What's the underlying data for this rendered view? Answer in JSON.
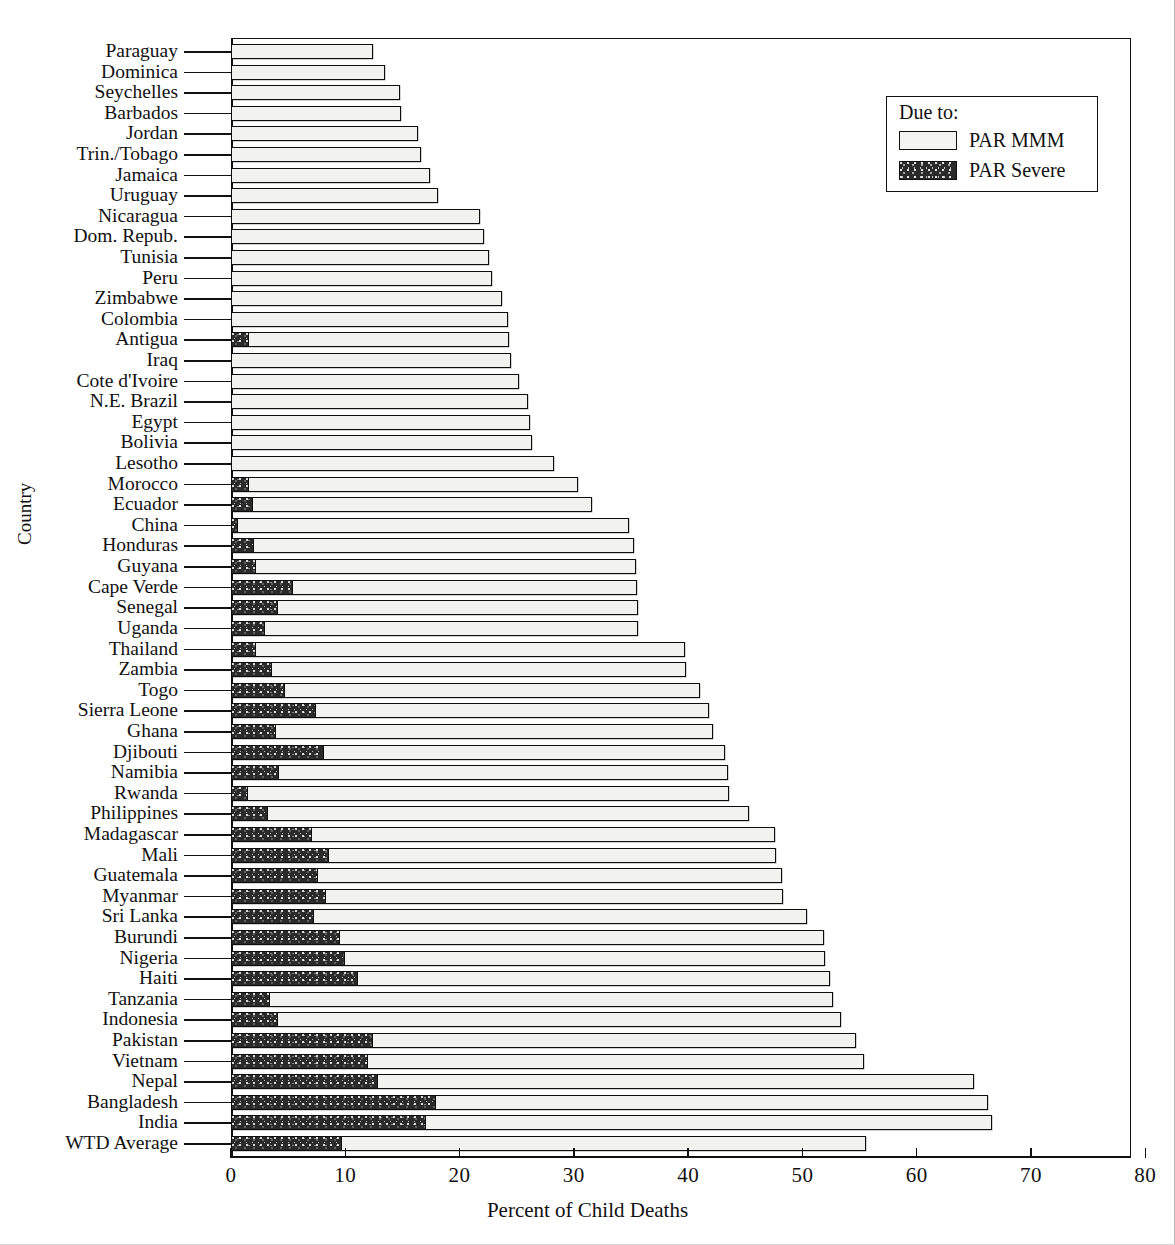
{
  "chart_data": {
    "type": "bar",
    "orientation": "horizontal",
    "stacked": true,
    "title": "",
    "xlabel": "Percent of Child Deaths",
    "ylabel": "Country",
    "xlim": [
      0,
      80
    ],
    "xticks": [
      0,
      10,
      20,
      30,
      40,
      50,
      60,
      70,
      80
    ],
    "grid": false,
    "legend": {
      "title": "Due to:",
      "position": "top-right",
      "entries": [
        {
          "label": "PAR MMM",
          "pattern": "light",
          "color": "#f2f2ef"
        },
        {
          "label": "PAR Severe",
          "pattern": "dark-stipple",
          "color": "#2a2a2a"
        }
      ]
    },
    "series": [
      {
        "name": "PAR Severe"
      },
      {
        "name": "PAR MMM"
      }
    ],
    "categories": [
      "Paraguay",
      "Dominica",
      "Seychelles",
      "Barbados",
      "Jordan",
      "Trin./Tobago",
      "Jamaica",
      "Uruguay",
      "Nicaragua",
      "Dom. Repub.",
      "Tunisia",
      "Peru",
      "Zimbabwe",
      "Colombia",
      "Antigua",
      "Iraq",
      "Cote d'Ivoire",
      "N.E. Brazil",
      "Egypt",
      "Bolivia",
      "Lesotho",
      "Morocco",
      "Ecuador",
      "China",
      "Honduras",
      "Guyana",
      "Cape Verde",
      "Senegal",
      "Uganda",
      "Thailand",
      "Zambia",
      "Togo",
      "Sierra Leone",
      "Ghana",
      "Djibouti",
      "Namibia",
      "Rwanda",
      "Philippines",
      "Madagascar",
      "Mali",
      "Guatemala",
      "Myanmar",
      "Sri Lanka",
      "Burundi",
      "Nigeria",
      "Haiti",
      "Tanzania",
      "Indonesia",
      "Pakistan",
      "Vietnam",
      "Nepal",
      "Bangladesh",
      "India",
      "WTD Average"
    ],
    "rows": [
      {
        "country": "Paraguay",
        "severe": 0.0,
        "total": 12.4
      },
      {
        "country": "Dominica",
        "severe": 0.0,
        "total": 13.5
      },
      {
        "country": "Seychelles",
        "severe": 0.0,
        "total": 14.8
      },
      {
        "country": "Barbados",
        "severe": 0.0,
        "total": 14.9
      },
      {
        "country": "Jordan",
        "severe": 0.0,
        "total": 16.4
      },
      {
        "country": "Trin./Tobago",
        "severe": 0.0,
        "total": 16.6
      },
      {
        "country": "Jamaica",
        "severe": 0.0,
        "total": 17.4
      },
      {
        "country": "Uruguay",
        "severe": 0.0,
        "total": 18.1
      },
      {
        "country": "Nicaragua",
        "severe": 0.0,
        "total": 21.8
      },
      {
        "country": "Dom. Repub.",
        "severe": 0.0,
        "total": 22.1
      },
      {
        "country": "Tunisia",
        "severe": 0.0,
        "total": 22.6
      },
      {
        "country": "Peru",
        "severe": 0.0,
        "total": 22.8
      },
      {
        "country": "Zimbabwe",
        "severe": 0.0,
        "total": 23.7
      },
      {
        "country": "Colombia",
        "severe": 0.0,
        "total": 24.2
      },
      {
        "country": "Antigua",
        "severe": 1.6,
        "total": 24.3
      },
      {
        "country": "Iraq",
        "severe": 0.0,
        "total": 24.5
      },
      {
        "country": "Cote d'Ivoire",
        "severe": 0.0,
        "total": 25.2
      },
      {
        "country": "N.E. Brazil",
        "severe": 0.0,
        "total": 26.0
      },
      {
        "country": "Egypt",
        "severe": 0.0,
        "total": 26.2
      },
      {
        "country": "Bolivia",
        "severe": 0.0,
        "total": 26.3
      },
      {
        "country": "Lesotho",
        "severe": 0.0,
        "total": 28.3
      },
      {
        "country": "Morocco",
        "severe": 1.6,
        "total": 30.4
      },
      {
        "country": "Ecuador",
        "severe": 1.9,
        "total": 31.6
      },
      {
        "country": "China",
        "severe": 0.6,
        "total": 34.8
      },
      {
        "country": "Honduras",
        "severe": 2.0,
        "total": 35.3
      },
      {
        "country": "Guyana",
        "severe": 2.2,
        "total": 35.4
      },
      {
        "country": "Cape Verde",
        "severe": 5.4,
        "total": 35.5
      },
      {
        "country": "Senegal",
        "severe": 4.1,
        "total": 35.6
      },
      {
        "country": "Uganda",
        "severe": 3.0,
        "total": 35.6
      },
      {
        "country": "Thailand",
        "severe": 2.2,
        "total": 39.7
      },
      {
        "country": "Zambia",
        "severe": 3.6,
        "total": 39.8
      },
      {
        "country": "Togo",
        "severe": 4.7,
        "total": 41.0
      },
      {
        "country": "Sierra Leone",
        "severe": 7.4,
        "total": 41.8
      },
      {
        "country": "Ghana",
        "severe": 3.9,
        "total": 42.2
      },
      {
        "country": "Djibouti",
        "severe": 8.1,
        "total": 43.2
      },
      {
        "country": "Namibia",
        "severe": 4.2,
        "total": 43.5
      },
      {
        "country": "Rwanda",
        "severe": 1.5,
        "total": 43.6
      },
      {
        "country": "Philippines",
        "severe": 3.2,
        "total": 45.3
      },
      {
        "country": "Madagascar",
        "severe": 7.1,
        "total": 47.6
      },
      {
        "country": "Mali",
        "severe": 8.6,
        "total": 47.7
      },
      {
        "country": "Guatemala",
        "severe": 7.6,
        "total": 48.2
      },
      {
        "country": "Myanmar",
        "severe": 8.3,
        "total": 48.3
      },
      {
        "country": "Sri Lanka",
        "severe": 7.3,
        "total": 50.4
      },
      {
        "country": "Burundi",
        "severe": 9.5,
        "total": 51.9
      },
      {
        "country": "Nigeria",
        "severe": 10.0,
        "total": 52.0
      },
      {
        "country": "Haiti",
        "severe": 11.1,
        "total": 52.4
      },
      {
        "country": "Tanzania",
        "severe": 3.4,
        "total": 52.7
      },
      {
        "country": "Indonesia",
        "severe": 4.1,
        "total": 53.4
      },
      {
        "country": "Pakistan",
        "severe": 12.4,
        "total": 54.7
      },
      {
        "country": "Vietnam",
        "severe": 12.0,
        "total": 55.4
      },
      {
        "country": "Nepal",
        "severe": 12.9,
        "total": 65.0
      },
      {
        "country": "Bangladesh",
        "severe": 17.9,
        "total": 66.2
      },
      {
        "country": "India",
        "severe": 17.1,
        "total": 66.6
      },
      {
        "country": "WTD Average",
        "severe": 9.7,
        "total": 55.6
      }
    ]
  }
}
